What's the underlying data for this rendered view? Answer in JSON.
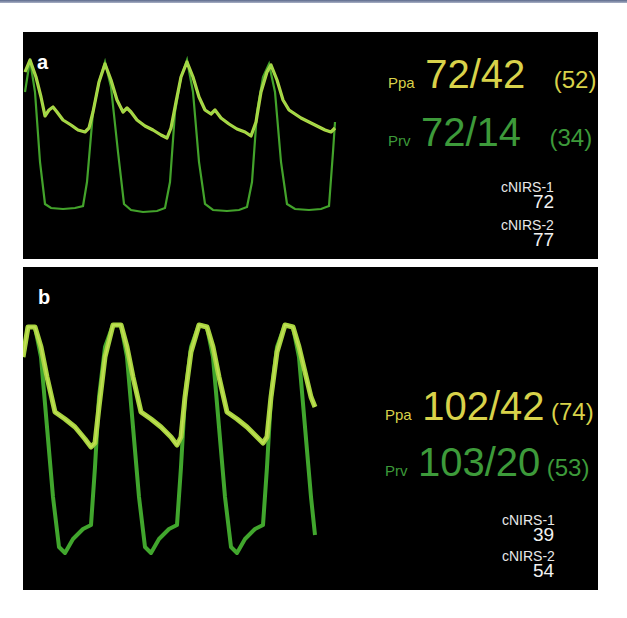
{
  "colors": {
    "ppa": "#d8d24a",
    "prv": "#3d9a3a",
    "trace_green": "#5ecf3a",
    "trace_yellow": "#c9d44a",
    "background": "#000000"
  },
  "panels": [
    {
      "letter": "a",
      "ppa": {
        "label": "Ppa",
        "value": "72/42",
        "mean": "(52)"
      },
      "prv": {
        "label": "Prv",
        "value": "72/14",
        "mean": "(34)"
      },
      "cnirs": [
        {
          "label": "cNIRS-1",
          "value": "72"
        },
        {
          "label": "cNIRS-2",
          "value": "77"
        }
      ]
    },
    {
      "letter": "b",
      "ppa": {
        "label": "Ppa",
        "value": "102/42",
        "mean": "(74)"
      },
      "prv": {
        "label": "Prv",
        "value": "103/20",
        "mean": "(53)"
      },
      "cnirs": [
        {
          "label": "cNIRS-1",
          "value": "39"
        },
        {
          "label": "cNIRS-2",
          "value": "54"
        }
      ]
    }
  ]
}
